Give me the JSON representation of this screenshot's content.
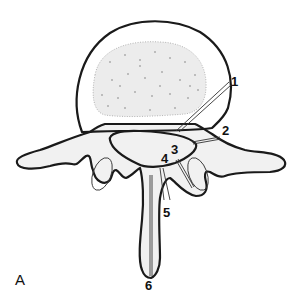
{
  "figure": {
    "panel_label": "A",
    "labels": [
      {
        "id": "1",
        "text": "1",
        "x": 231,
        "y": 77
      },
      {
        "id": "2",
        "text": "2",
        "x": 224,
        "y": 126
      },
      {
        "id": "3",
        "text": "3",
        "x": 171,
        "y": 145
      },
      {
        "id": "4",
        "text": "4",
        "x": 160,
        "y": 154
      },
      {
        "id": "5",
        "text": "5",
        "x": 163,
        "y": 208
      },
      {
        "id": "6",
        "text": "6",
        "x": 146,
        "y": 278
      }
    ],
    "colors": {
      "outline": "#1a1a1a",
      "bone_fill": "#f1f1f1",
      "background": "#ffffff"
    }
  }
}
